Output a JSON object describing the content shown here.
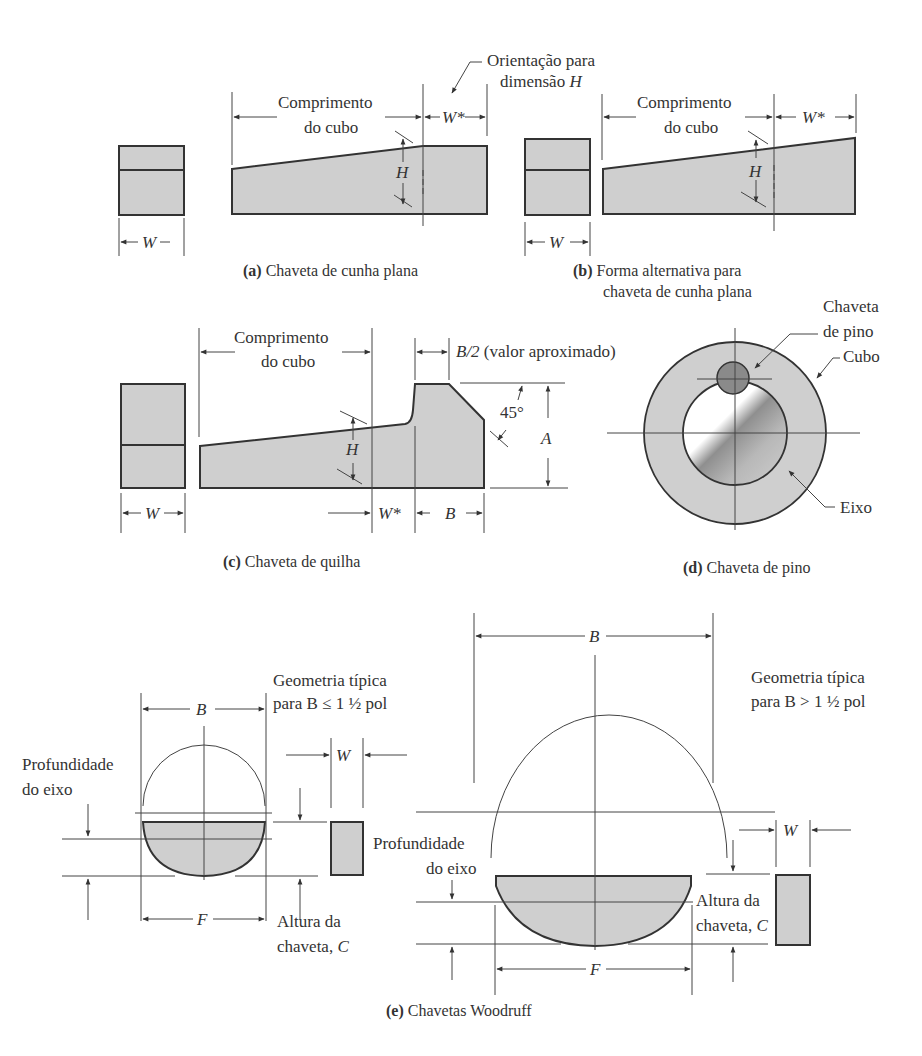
{
  "figure": {
    "a": {
      "caption_letter": "(a)",
      "caption_text": " Chaveta de cunha plana",
      "hub_length_line1": "Comprimento",
      "hub_length_line2": "do cubo",
      "w_star": "W*",
      "h": "H",
      "w": "W",
      "orientation_line1": "Orientação para",
      "orientation_line2": "dimensão ",
      "orientation_var": "H"
    },
    "b": {
      "caption_letter": "(b)",
      "caption_line1": " Forma alternativa para",
      "caption_line2": "chaveta de cunha plana",
      "hub_length_line1": "Comprimento",
      "hub_length_line2": "do cubo",
      "w_star": "W*",
      "h": "H",
      "w": "W"
    },
    "c": {
      "caption_letter": "(c)",
      "caption_text": " Chaveta de quilha",
      "hub_length_line1": "Comprimento",
      "hub_length_line2": "do cubo",
      "b_half_var": "B/2",
      "b_half_note": " (valor aproximado)",
      "angle": "45°",
      "a": "A",
      "h": "H",
      "w_star": "W*",
      "b": "B",
      "w": "W"
    },
    "d": {
      "caption_letter": "(d)",
      "caption_text": " Chaveta de pino",
      "pin_key_line1": "Chaveta",
      "pin_key_line2": "de pino",
      "hub": "Cubo",
      "shaft": "Eixo"
    },
    "e": {
      "caption_letter": "(e)",
      "caption_text": " Chavetas Woodruff",
      "small": {
        "geometry_line1": "Geometria típica",
        "geometry_line2": "para B ≤ 1 ½ pol",
        "b": "B",
        "w": "W",
        "f": "F",
        "shaft_depth_line1": "Profundidade",
        "shaft_depth_line2": "do eixo",
        "key_height_line1": "Altura da",
        "key_height_line2": "chaveta, ",
        "key_height_var": "C"
      },
      "large": {
        "geometry_line1": "Geometria típica",
        "geometry_line2": "para B > 1 ½ pol",
        "b": "B",
        "w": "W",
        "f": "F",
        "shaft_depth_line1": "Profundidade",
        "shaft_depth_line2": "do eixo",
        "key_height_line1": "Altura da",
        "key_height_line2": "chaveta, ",
        "key_height_var": "C"
      }
    }
  },
  "colors": {
    "fill_gray": "#cfcfcf",
    "pin_dark": "#8a8a8a",
    "line": "#333333"
  }
}
